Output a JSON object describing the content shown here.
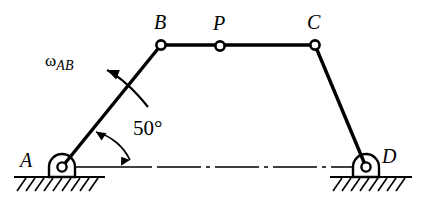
{
  "figure": {
    "kind": "four-bar linkage mechanism diagram",
    "background_color": "#ffffff",
    "stroke_color": "#000000",
    "width": 422,
    "height": 212
  },
  "labels": {
    "joint_a": "A",
    "joint_b": "B",
    "joint_p": "P",
    "joint_c": "C",
    "joint_d": "D",
    "angle": "50°",
    "omega_symbol": "ω",
    "omega_subscript": "AB"
  },
  "geometry": {
    "joints": [
      {
        "name": "A",
        "x": 62,
        "y": 167,
        "type": "fixed-pivot"
      },
      {
        "name": "B",
        "x": 161,
        "y": 45,
        "type": "pin-joint"
      },
      {
        "name": "P",
        "x": 220,
        "y": 46,
        "type": "pin-joint"
      },
      {
        "name": "C",
        "x": 315,
        "y": 45,
        "type": "pin-joint"
      },
      {
        "name": "D",
        "x": 366,
        "y": 167,
        "type": "fixed-pivot"
      }
    ],
    "links": [
      {
        "name": "AB",
        "from": "A",
        "to": "B"
      },
      {
        "name": "BC",
        "from": "B",
        "to": "C"
      },
      {
        "name": "CD",
        "from": "C",
        "to": "D"
      }
    ],
    "ground_line_y": 167,
    "ground_hatch_y": 177,
    "crank_angle_degrees": 50
  },
  "annotations": {
    "angle_arc_label": "50°",
    "omega_label": "ωAB",
    "omega_direction": "counterclockwise"
  }
}
